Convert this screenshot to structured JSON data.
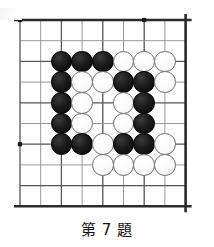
{
  "caption": {
    "prefix": "第",
    "number": "7",
    "suffix": "題"
  },
  "board": {
    "columns": 9,
    "rows": 10,
    "cell_size": 20.7,
    "origin_x": 20.0,
    "origin_y": 20.0,
    "stone_diameter": 21.5,
    "line_color": "#8c8c8c",
    "major_line_color": "#55555a",
    "edge_color": "#2b2b2b",
    "black_color": "#151515",
    "white_color": "#fdfdfd",
    "white_border_color": "#6e6e6e",
    "edges": {
      "top": true,
      "right": true,
      "bottom": true,
      "left": false
    },
    "star_points": [
      {
        "col": 0,
        "row": 0
      },
      {
        "col": 6,
        "row": 0
      },
      {
        "col": 0,
        "row": 6
      }
    ],
    "stones": [
      {
        "col": 2,
        "row": 2,
        "color": "black"
      },
      {
        "col": 3,
        "row": 2,
        "color": "black"
      },
      {
        "col": 4,
        "row": 2,
        "color": "black"
      },
      {
        "col": 5,
        "row": 2,
        "color": "white"
      },
      {
        "col": 6,
        "row": 2,
        "color": "white"
      },
      {
        "col": 7,
        "row": 2,
        "color": "white"
      },
      {
        "col": 2,
        "row": 3,
        "color": "black"
      },
      {
        "col": 3,
        "row": 3,
        "color": "white"
      },
      {
        "col": 4,
        "row": 3,
        "color": "white"
      },
      {
        "col": 5,
        "row": 3,
        "color": "black"
      },
      {
        "col": 6,
        "row": 3,
        "color": "black"
      },
      {
        "col": 7,
        "row": 3,
        "color": "white"
      },
      {
        "col": 2,
        "row": 4,
        "color": "black"
      },
      {
        "col": 3,
        "row": 4,
        "color": "white"
      },
      {
        "col": 5,
        "row": 4,
        "color": "white"
      },
      {
        "col": 6,
        "row": 4,
        "color": "black"
      },
      {
        "col": 2,
        "row": 5,
        "color": "black"
      },
      {
        "col": 3,
        "row": 5,
        "color": "white"
      },
      {
        "col": 5,
        "row": 5,
        "color": "white"
      },
      {
        "col": 6,
        "row": 5,
        "color": "black"
      },
      {
        "col": 2,
        "row": 6,
        "color": "black"
      },
      {
        "col": 3,
        "row": 6,
        "color": "black"
      },
      {
        "col": 4,
        "row": 6,
        "color": "white"
      },
      {
        "col": 5,
        "row": 6,
        "color": "black"
      },
      {
        "col": 6,
        "row": 6,
        "color": "black"
      },
      {
        "col": 7,
        "row": 6,
        "color": "white"
      },
      {
        "col": 4,
        "row": 7,
        "color": "white"
      },
      {
        "col": 5,
        "row": 7,
        "color": "white"
      },
      {
        "col": 6,
        "row": 7,
        "color": "white"
      },
      {
        "col": 7,
        "row": 7,
        "color": "white"
      }
    ]
  }
}
